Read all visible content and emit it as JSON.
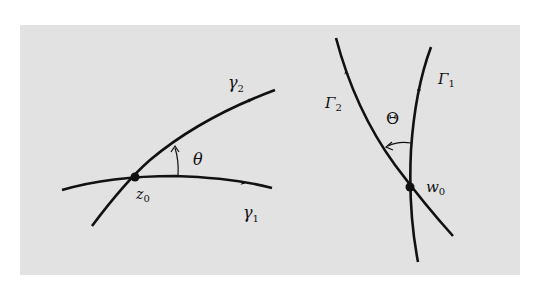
{
  "figure": {
    "background_color": "#e2e2e2",
    "stroke_color": "#111111",
    "left_diagram": {
      "point_label": "z",
      "point_subscript": "0",
      "curve1_label": "γ",
      "curve1_subscript": "1",
      "curve2_label": "γ",
      "curve2_subscript": "2",
      "angle_label": "θ"
    },
    "right_diagram": {
      "point_label": "w",
      "point_subscript": "0",
      "curve1_label": "Γ",
      "curve1_subscript": "1",
      "curve2_label": "Γ",
      "curve2_subscript": "2",
      "angle_label": "Θ"
    }
  }
}
